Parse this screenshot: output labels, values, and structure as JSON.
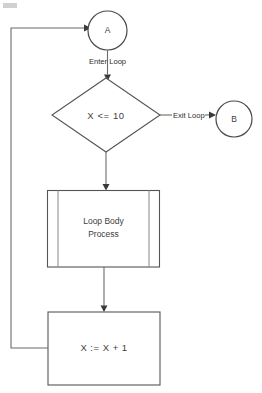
{
  "diagram": {
    "background_color": "#ffffff",
    "line_color": "#6b6b6b",
    "text_color": "#3d3d3d"
  },
  "nodes": {
    "connector_a": {
      "label": "A",
      "shape": "circle",
      "type": "on-page-connector"
    },
    "decision": {
      "label": "X <= 10",
      "shape": "diamond",
      "type": "decision"
    },
    "connector_b": {
      "label": "B",
      "shape": "circle",
      "type": "on-page-connector"
    },
    "loop_body": {
      "label_line1": "Loop Body",
      "label_line2": "Process",
      "shape": "predefined-process",
      "type": "subroutine"
    },
    "increment": {
      "label": "X := X + 1",
      "shape": "rectangle",
      "type": "process"
    }
  },
  "edges": {
    "enter_loop": {
      "label": "Enter Loop"
    },
    "exit_loop": {
      "label": "Exit Loop"
    },
    "feedback": {
      "label": ""
    }
  }
}
